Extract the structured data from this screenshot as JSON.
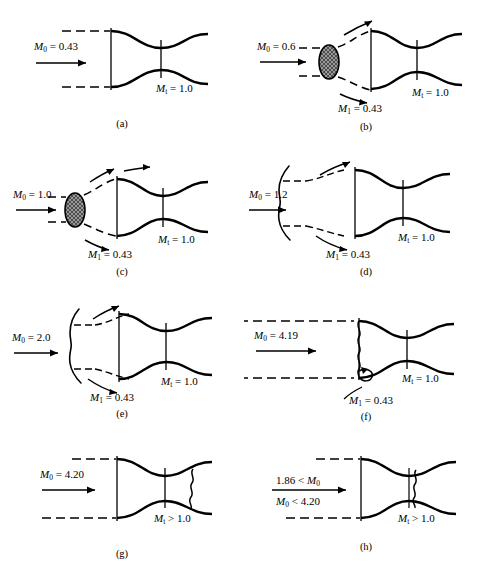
{
  "figure": {
    "title_hidden": "",
    "background_color": "#ffffff",
    "line_color": "#000000",
    "shock_fill": "#9a9a9a"
  },
  "panels": [
    {
      "id": "a",
      "caption": "(a)",
      "inlet_label": {
        "symbol": "M",
        "subscript": "0",
        "relation": "=",
        "value": "0.43"
      },
      "throat_label": {
        "symbol": "M",
        "subscript": "t",
        "relation": "=",
        "value": "1.0"
      },
      "secondary_label": null,
      "features": {
        "upstream_dashed_streamlines": true,
        "normal_shock_ellipse": false,
        "bow_shock_curve": false,
        "inlet_wavy_shock": false,
        "throat_wavy_shock": false,
        "downstream_wavy_shock": false,
        "spillage_arrows": false,
        "inlet_curl": false
      }
    },
    {
      "id": "b",
      "caption": "(b)",
      "inlet_label": {
        "symbol": "M",
        "subscript": "0",
        "relation": "=",
        "value": "0.6"
      },
      "throat_label": {
        "symbol": "M",
        "subscript": "t",
        "relation": "=",
        "value": "1.0"
      },
      "secondary_label": {
        "symbol": "M",
        "subscript": "1",
        "relation": "=",
        "value": "0.43"
      },
      "features": {
        "upstream_dashed_streamlines": true,
        "normal_shock_ellipse": true,
        "bow_shock_curve": false,
        "inlet_wavy_shock": false,
        "throat_wavy_shock": false,
        "downstream_wavy_shock": false,
        "spillage_arrows": true,
        "inlet_curl": false
      }
    },
    {
      "id": "c",
      "caption": "(c)",
      "inlet_label": {
        "symbol": "M",
        "subscript": "0",
        "relation": "=",
        "value": "1.0"
      },
      "throat_label": {
        "symbol": "M",
        "subscript": "t",
        "relation": "=",
        "value": "1.0"
      },
      "secondary_label": {
        "symbol": "M",
        "subscript": "1",
        "relation": "=",
        "value": "0.43"
      },
      "features": {
        "upstream_dashed_streamlines": true,
        "normal_shock_ellipse": true,
        "bow_shock_curve": false,
        "inlet_wavy_shock": false,
        "throat_wavy_shock": false,
        "downstream_wavy_shock": false,
        "spillage_arrows": true,
        "inlet_curl": false
      }
    },
    {
      "id": "d",
      "caption": "(d)",
      "inlet_label": {
        "symbol": "M",
        "subscript": "0",
        "relation": "=",
        "value": "1.2"
      },
      "throat_label": {
        "symbol": "M",
        "subscript": "t",
        "relation": "=",
        "value": "1.0"
      },
      "secondary_label": {
        "symbol": "M",
        "subscript": "1",
        "relation": "=",
        "value": "0.43"
      },
      "features": {
        "upstream_dashed_streamlines": true,
        "normal_shock_ellipse": false,
        "bow_shock_curve": true,
        "inlet_wavy_shock": false,
        "throat_wavy_shock": false,
        "downstream_wavy_shock": false,
        "spillage_arrows": true,
        "inlet_curl": false
      }
    },
    {
      "id": "e",
      "caption": "(e)",
      "inlet_label": {
        "symbol": "M",
        "subscript": "0",
        "relation": "=",
        "value": "2.0"
      },
      "throat_label": {
        "symbol": "M",
        "subscript": "t",
        "relation": "=",
        "value": "1.0"
      },
      "secondary_label": {
        "symbol": "M",
        "subscript": "1",
        "relation": "=",
        "value": "0.43"
      },
      "features": {
        "upstream_dashed_streamlines": true,
        "normal_shock_ellipse": false,
        "bow_shock_curve": true,
        "inlet_wavy_shock": false,
        "throat_wavy_shock": false,
        "downstream_wavy_shock": false,
        "spillage_arrows": true,
        "inlet_curl": false
      }
    },
    {
      "id": "f",
      "caption": "(f)",
      "inlet_label": {
        "symbol": "M",
        "subscript": "0",
        "relation": "=",
        "value": "4.19"
      },
      "throat_label": {
        "symbol": "M",
        "subscript": "t",
        "relation": "=",
        "value": "1.0"
      },
      "secondary_label": {
        "symbol": "M",
        "subscript": "1",
        "relation": "=",
        "value": "0.43"
      },
      "features": {
        "upstream_dashed_streamlines": true,
        "normal_shock_ellipse": false,
        "bow_shock_curve": false,
        "inlet_wavy_shock": true,
        "throat_wavy_shock": false,
        "downstream_wavy_shock": false,
        "spillage_arrows": false,
        "inlet_curl": true
      }
    },
    {
      "id": "g",
      "caption": "(g)",
      "inlet_label": {
        "symbol": "M",
        "subscript": "0",
        "relation": "=",
        "value": "4.20"
      },
      "throat_label": {
        "symbol": "M",
        "subscript": "t",
        "relation": ">",
        "value": "1.0"
      },
      "secondary_label": null,
      "features": {
        "upstream_dashed_streamlines": true,
        "normal_shock_ellipse": false,
        "bow_shock_curve": false,
        "inlet_wavy_shock": false,
        "throat_wavy_shock": false,
        "downstream_wavy_shock": true,
        "spillage_arrows": false,
        "inlet_curl": false
      }
    },
    {
      "id": "h",
      "caption": "(h)",
      "inlet_label_fraction": {
        "numerator": {
          "value": "1.86",
          "relation": "<",
          "symbol": "M",
          "subscript": "0"
        },
        "denominator": {
          "symbol": "M",
          "subscript": "0",
          "relation": "<",
          "value": "4.20"
        }
      },
      "inlet_label": null,
      "throat_label": {
        "symbol": "M",
        "subscript": "t",
        "relation": ">",
        "value": "1.0"
      },
      "secondary_label": null,
      "features": {
        "upstream_dashed_streamlines": true,
        "normal_shock_ellipse": false,
        "bow_shock_curve": false,
        "inlet_wavy_shock": false,
        "throat_wavy_shock": true,
        "downstream_wavy_shock": false,
        "spillage_arrows": false,
        "inlet_curl": false
      }
    }
  ]
}
